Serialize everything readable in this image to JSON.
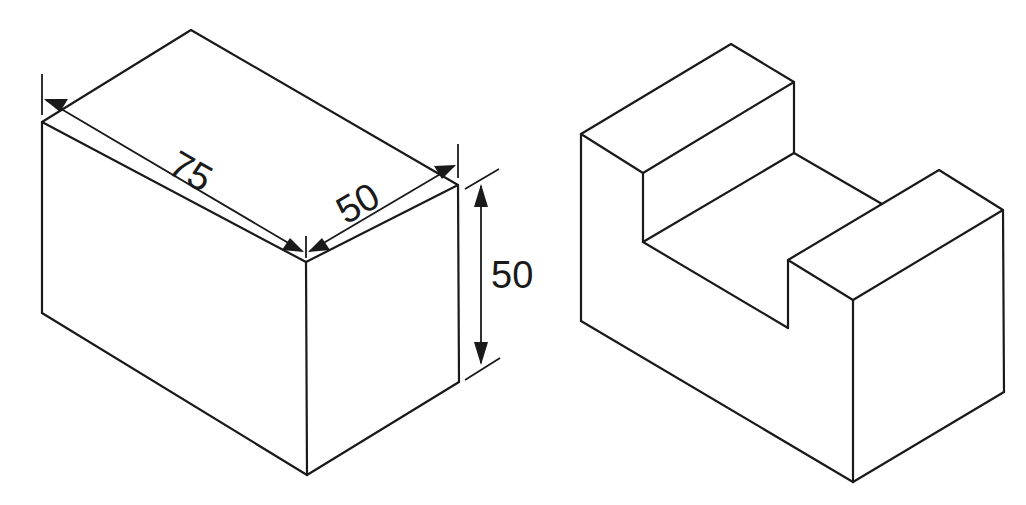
{
  "diagram": {
    "type": "isometric-engineering-drawing",
    "figures": [
      {
        "name": "dimensioned-rectangular-block",
        "dimensions": {
          "length": "75",
          "width": "50",
          "height": "50"
        }
      },
      {
        "name": "u-channel-block",
        "dimensions": {}
      }
    ]
  }
}
